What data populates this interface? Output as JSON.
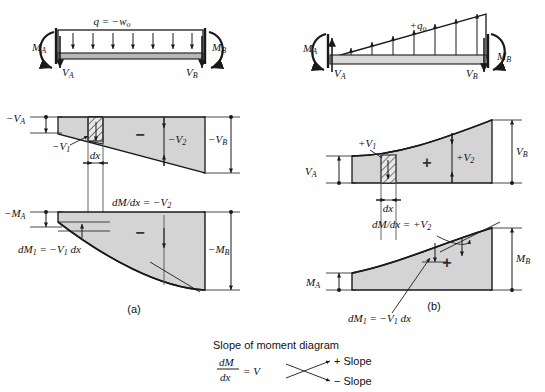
{
  "figure": {
    "panels": [
      {
        "key": "a",
        "caption": "(a)",
        "beam": {
          "load_label": "q = −w",
          "load_sub": "o",
          "moment_left": "M",
          "moment_left_sub": "A",
          "moment_right": "M",
          "moment_right_sub": "B",
          "shear_left": "V",
          "shear_left_sub": "A",
          "shear_right": "V",
          "shear_right_sub": "B",
          "load_direction": "down",
          "load_shape": "uniform"
        },
        "shear_diagram": {
          "left_label": "−V",
          "left_sub": "A",
          "right_label": "−V",
          "right_sub": "B",
          "v1_label": "−V",
          "v1_sub": "1",
          "v2_label": "−V",
          "v2_sub": "2",
          "dx_label": "dx",
          "sign": "−"
        },
        "moment_diagram": {
          "left_label": "−M",
          "left_sub": "A",
          "right_label": "−M",
          "right_sub": "B",
          "slope_label": "dM/dx = −V",
          "slope_sub": "2",
          "dm_label": "dM",
          "dm_sub": "1",
          "dm_rest": " = −V",
          "dm_rest_sub": "1",
          "dm_tail": " dx",
          "sign": "−"
        }
      },
      {
        "key": "b",
        "caption": "(b)",
        "beam": {
          "load_label": "+q",
          "load_sub": "o",
          "moment_left": "M",
          "moment_left_sub": "A",
          "moment_right": "M",
          "moment_right_sub": "B",
          "shear_left": "V",
          "shear_left_sub": "A",
          "shear_right": "V",
          "shear_right_sub": "B",
          "load_direction": "up",
          "load_shape": "triangular"
        },
        "shear_diagram": {
          "left_label": "V",
          "left_sub": "A",
          "right_label": "V",
          "right_sub": "B",
          "v1_label": "+V",
          "v1_sub": "1",
          "v2_label": "+V",
          "v2_sub": "2",
          "dx_label": "dx",
          "sign": "+"
        },
        "moment_diagram": {
          "left_label": "M",
          "left_sub": "A",
          "right_label": "M",
          "right_sub": "B",
          "slope_label": "dM/dx = +V",
          "slope_sub": "2",
          "dm_label": "dM",
          "dm_sub": "1",
          "dm_rest": " = −V",
          "dm_rest_sub": "1",
          "dm_tail": " dx",
          "sign": "+"
        }
      }
    ],
    "legend": {
      "title": "Slope of moment diagram",
      "frac_num": "dM",
      "frac_den": "dx",
      "frac_eq": "= V",
      "plus_item": "+ Slope",
      "minus_item": "− Slope"
    },
    "colors": {
      "fill": "#d4d4d4",
      "stroke": "#1a1a1a",
      "beam_bar": "#b8b8b8",
      "background": "#ffffff"
    }
  }
}
